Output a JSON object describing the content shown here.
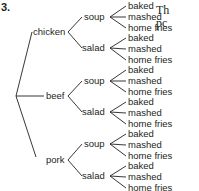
{
  "problem_number": "3.",
  "side_text": [
    "Th",
    "pc"
  ],
  "tree": {
    "level1": [
      "chicken",
      "beef",
      "pork"
    ],
    "level2": [
      "soup",
      "salad"
    ],
    "level3": [
      "baked",
      "mashed",
      "home fries"
    ]
  },
  "labels": {
    "chicken": "chicken",
    "beef": "beef",
    "pork": "pork",
    "soup": "soup",
    "salad": "salad",
    "baked": "baked",
    "mashed": "mashed",
    "home_fries": "home fries"
  }
}
